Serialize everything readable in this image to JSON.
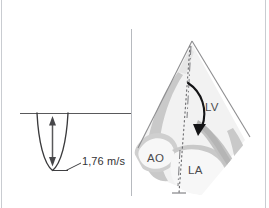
{
  "figure": {
    "colors": {
      "frame": "#c9ccd1",
      "divider": "#b7babf",
      "trace": "#3a3a3c",
      "baseline": "#59595b",
      "arrow": "#58585a",
      "tissue_light": "#d8d8d8",
      "tissue_mid": "#c3c3c3",
      "tissue_dark": "#a9a9a9",
      "sector_outline": "#8e8e90",
      "flow_arrow": "#1a1a1a",
      "text": "#4a4a4d"
    }
  },
  "left_panel": {
    "name": "doppler-spectral-trace",
    "velocity_label": "1,76 m/s",
    "baseline_present": true,
    "waveform_direction": "below-baseline",
    "arrow": "double-headed-vertical"
  },
  "right_panel": {
    "name": "echocardiographic-sector-diagram",
    "labels": {
      "lv": "LV",
      "ao": "AO",
      "la": "LA"
    },
    "scanline": "dotted",
    "centerline": "dash-dot",
    "flow_arrow": "curved-downward"
  }
}
